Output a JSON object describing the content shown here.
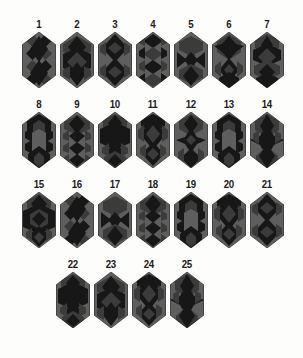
{
  "figure": {
    "type": "tile-pattern-plate",
    "background_color": "#fdfdfb",
    "tile_shape": "elongated-hexagon",
    "tone_palette": {
      "dark": "#171717",
      "mid": "#3b3b3b",
      "light": "#5e5e5e",
      "label": "#1b1b1b"
    },
    "rows": [
      {
        "row_index": 1,
        "tiles": [
          {
            "label": "1",
            "pattern": "rhombus-lattice-alt"
          },
          {
            "label": "2",
            "pattern": "rhombus-lattice-banded"
          },
          {
            "label": "3",
            "pattern": "central-diamond-column"
          },
          {
            "label": "4",
            "pattern": "zigzag-chevron"
          },
          {
            "label": "5",
            "pattern": "hourglass-center"
          },
          {
            "label": "6",
            "pattern": "star-upper-band"
          },
          {
            "label": "7",
            "pattern": "split-band-diamond"
          }
        ]
      },
      {
        "row_index": 2,
        "tiles": [
          {
            "label": "8",
            "pattern": "light-hexagon-core"
          },
          {
            "label": "9",
            "pattern": "diamond-stack-dark"
          },
          {
            "label": "10",
            "pattern": "broad-center-band"
          },
          {
            "label": "11",
            "pattern": "double-diamond-column"
          },
          {
            "label": "12",
            "pattern": "star-center-narrow"
          },
          {
            "label": "13",
            "pattern": "light-hexagon-core"
          },
          {
            "label": "14",
            "pattern": "six-point-star-dark"
          }
        ]
      },
      {
        "row_index": 3,
        "tiles": [
          {
            "label": "15",
            "pattern": "wide-dark-band"
          },
          {
            "label": "16",
            "pattern": "rhombus-lattice-alt"
          },
          {
            "label": "17",
            "pattern": "hourglass-center"
          },
          {
            "label": "18",
            "pattern": "diamond-stack-dark"
          },
          {
            "label": "19",
            "pattern": "light-hexagon-core"
          },
          {
            "label": "20",
            "pattern": "double-diamond-column"
          },
          {
            "label": "21",
            "pattern": "central-diamond-column"
          }
        ]
      },
      {
        "row_index": 4,
        "tiles": [
          {
            "label": "22",
            "pattern": "broad-center-band"
          },
          {
            "label": "23",
            "pattern": "rhombus-lattice-banded"
          },
          {
            "label": "24",
            "pattern": "double-diamond-column"
          },
          {
            "label": "25",
            "pattern": "six-point-star-dark"
          }
        ]
      }
    ]
  }
}
